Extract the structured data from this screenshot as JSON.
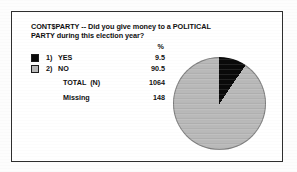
{
  "figure": {
    "title": "CONT$PARTY -- Did you give money to a POLITICAL PARTY during this election year?",
    "percent_header": "%",
    "legend": [
      {
        "number": "1)",
        "label": "YES",
        "value": "9.5",
        "color": "#0a0a0a",
        "swatch": "black-swatch"
      },
      {
        "number": "2)",
        "label": "NO",
        "value": "90.5",
        "color": "#b9b9b9",
        "swatch": "gray-swatch"
      }
    ],
    "summary": [
      {
        "label": "TOTAL  (N)",
        "value": "1064"
      },
      {
        "label": "Missing",
        "value": "148"
      }
    ]
  },
  "chart_data": {
    "type": "pie",
    "title": "CONT$PARTY -- Did you give money to a POLITICAL PARTY during this election year?",
    "categories": [
      "1) YES",
      "2) NO"
    ],
    "values": [
      9.5,
      90.5
    ],
    "value_unit": "%",
    "colors": [
      "#0a0a0a",
      "#b9b9b9"
    ],
    "total_n": 1064,
    "missing": 148,
    "legend_position": "left",
    "start_angle_deg": 0,
    "direction": "clockwise",
    "labels_shown": false,
    "grid": false
  }
}
